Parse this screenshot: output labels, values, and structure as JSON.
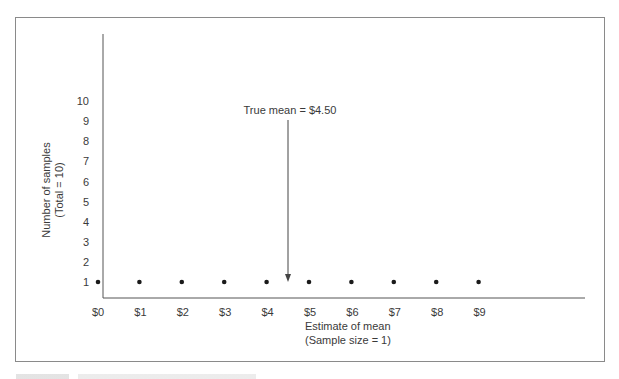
{
  "chart_data": {
    "type": "scatter",
    "title": "",
    "xlabel": "Estimate of mean",
    "xlabel_sub": "(Sample size = 1)",
    "ylabel": "Number of samples",
    "ylabel_sub": "(Total = 10)",
    "x_ticks": [
      "$0",
      "$1",
      "$2",
      "$3",
      "$4",
      "$5",
      "$6",
      "$7",
      "$8",
      "$9"
    ],
    "y_ticks": [
      "1",
      "2",
      "3",
      "4",
      "5",
      "6",
      "7",
      "8",
      "9",
      "10"
    ],
    "x": [
      0,
      1,
      2,
      3,
      4,
      5,
      6,
      7,
      8,
      9
    ],
    "y": [
      1,
      1,
      1,
      1,
      1,
      1,
      1,
      1,
      1,
      1
    ],
    "xlim": [
      0,
      9
    ],
    "ylim": [
      0,
      10
    ],
    "grid": false,
    "legend": null,
    "annotations": [
      {
        "text": "True mean  =  $4.50",
        "x": 4.5,
        "y": 1,
        "type": "arrow"
      }
    ]
  },
  "colors": {
    "ink": "#3a3a3a",
    "frame": "#8a8a8a",
    "background": "#ffffff"
  }
}
